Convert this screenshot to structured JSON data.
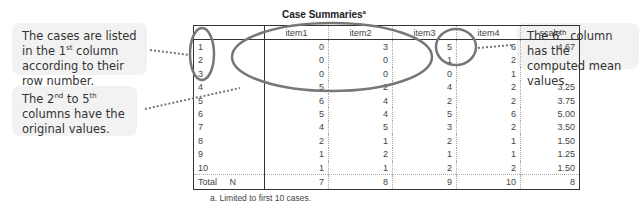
{
  "callouts": {
    "left_top": {
      "pre": "The cases are listed in the ",
      "sup_base": "1",
      "sup": "st",
      "post": " column according to their row number."
    },
    "left_bottom": {
      "pre": "The ",
      "n1": "2",
      "s1": "nd",
      "mid": " to ",
      "n2": "5",
      "s2": "th",
      "post": " columns have the original values."
    },
    "right": {
      "pre": "The ",
      "n": "6",
      "s": "th",
      "post": " column has the computed mean values."
    }
  },
  "table": {
    "title": "Case Summaries",
    "title_sup": "a",
    "headers": [
      "",
      "item1",
      "item2",
      "item3",
      "item4",
      "scale"
    ],
    "rows": [
      {
        "label": "1",
        "values": [
          "0",
          "3",
          "5",
          "6",
          "4.67"
        ]
      },
      {
        "label": "2",
        "values": [
          "0",
          "0",
          "1",
          "2",
          ""
        ]
      },
      {
        "label": "3",
        "values": [
          "0",
          "0",
          "0",
          "1",
          ""
        ]
      },
      {
        "label": "4",
        "values": [
          "5",
          "2",
          "4",
          "2",
          "3.25"
        ]
      },
      {
        "label": "5",
        "values": [
          "6",
          "4",
          "2",
          "2",
          "3.75"
        ]
      },
      {
        "label": "6",
        "values": [
          "5",
          "4",
          "5",
          "6",
          "5.00"
        ]
      },
      {
        "label": "7",
        "values": [
          "4",
          "5",
          "3",
          "2",
          "3.50"
        ]
      },
      {
        "label": "8",
        "values": [
          "2",
          "1",
          "2",
          "1",
          "1.50"
        ]
      },
      {
        "label": "9",
        "values": [
          "1",
          "2",
          "1",
          "1",
          "1.25"
        ]
      },
      {
        "label": "10",
        "values": [
          "1",
          "1",
          "2",
          "2",
          "1.50"
        ]
      }
    ],
    "total": {
      "label": "Total",
      "sublabel": "N",
      "values": [
        "7",
        "8",
        "9",
        "10",
        "8"
      ]
    },
    "footnote": "a. Limited to first 10 cases."
  }
}
